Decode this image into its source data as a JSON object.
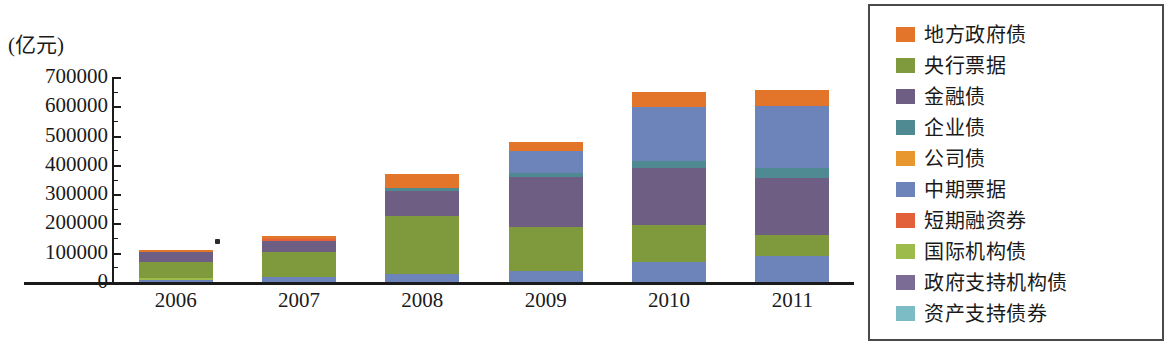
{
  "axes": {
    "unit_label": "(亿元)",
    "y_ticks": [
      "700000",
      "600000",
      "500000",
      "400000",
      "300000",
      "200000",
      "100000",
      "0"
    ],
    "x_ticks": [
      "2006",
      "2007",
      "2008",
      "2009",
      "2010",
      "2011"
    ]
  },
  "legend": {
    "items": [
      {
        "label": "地方政府债",
        "color": "#e2752a"
      },
      {
        "label": "央行票据",
        "color": "#7f9a3c"
      },
      {
        "label": "金融债",
        "color": "#6e5e84"
      },
      {
        "label": "企业债",
        "color": "#4f8a92"
      },
      {
        "label": "公司债",
        "color": "#e8972f"
      },
      {
        "label": "中期票据",
        "color": "#6d84bb"
      },
      {
        "label": "短期融资券",
        "color": "#e2603a"
      },
      {
        "label": "国际机构债",
        "color": "#9cbb4a"
      },
      {
        "label": "政府支持机构债",
        "color": "#7b6c96"
      },
      {
        "label": "资产支持债券",
        "color": "#7cbcc4"
      }
    ]
  },
  "chart_data": {
    "type": "bar",
    "subtype": "stacked",
    "title": "",
    "xlabel": "",
    "ylabel": "(亿元)",
    "ylim": [
      0,
      700000
    ],
    "y_tick_step": 100000,
    "y_minor_tick_step": 50000,
    "grid": false,
    "legend_position": "right",
    "categories": [
      "2006",
      "2007",
      "2008",
      "2009",
      "2010",
      "2011"
    ],
    "series": [
      {
        "name": "中期票据",
        "color": "#6d84bb",
        "values": [
          6000,
          16000,
          29000,
          36000,
          66000,
          86000
        ]
      },
      {
        "name": "国际机构债",
        "color": "#9cbb4a",
        "values": [
          2000,
          2000,
          2000,
          2000,
          2000,
          2000
        ]
      },
      {
        "name": "央行票据",
        "color": "#7f9a3c",
        "values": [
          55000,
          86000,
          196000,
          148000,
          124000,
          73000
        ]
      },
      {
        "name": "金融债",
        "color": "#6e5e84",
        "values": [
          30000,
          35000,
          74000,
          158000,
          196000,
          192000
        ]
      },
      {
        "name": "企业债",
        "color": "#4f8a92",
        "values": [
          2000,
          2000,
          6000,
          11000,
          22000,
          33000
        ]
      },
      {
        "name": "短期融资券",
        "color": "#6d84bb",
        "values": [
          3000,
          7000,
          40000,
          78000,
          186000,
          214000
        ]
      },
      {
        "name": "地方政府债",
        "color": "#e2752a",
        "values": [
          7000,
          7000,
          23000,
          47000,
          54000,
          55000
        ]
      }
    ],
    "totals": [
      105000,
      155000,
      370000,
      480000,
      650000,
      655000
    ],
    "bar_segments": [
      {
        "category": "2006",
        "segments": [
          {
            "name": "中期票据",
            "color": "#6d84bb",
            "value": 6000
          },
          {
            "name": "国际机构债",
            "color": "#9cbb4a",
            "value": 2000
          },
          {
            "name": "央行票据",
            "color": "#7f9a3c",
            "value": 55000
          },
          {
            "name": "金融债",
            "color": "#6e5e84",
            "value": 33000
          },
          {
            "name": "地方政府债",
            "color": "#e2752a",
            "value": 9000
          }
        ]
      },
      {
        "category": "2007",
        "segments": [
          {
            "name": "中期票据",
            "color": "#6d84bb",
            "value": 16000
          },
          {
            "name": "央行票据",
            "color": "#7f9a3c",
            "value": 88000
          },
          {
            "name": "金融债",
            "color": "#6e5e84",
            "value": 37000
          },
          {
            "name": "短期融资券",
            "color": "#e2603a",
            "value": 5000
          },
          {
            "name": "地方政府债",
            "color": "#e2752a",
            "value": 9000
          }
        ]
      },
      {
        "category": "2008",
        "segments": [
          {
            "name": "中期票据",
            "color": "#6d84bb",
            "value": 29000
          },
          {
            "name": "央行票据",
            "color": "#7f9a3c",
            "value": 198000
          },
          {
            "name": "金融债",
            "color": "#6e5e84",
            "value": 85000
          },
          {
            "name": "企业债",
            "color": "#4f8a92",
            "value": 9000
          },
          {
            "name": "地方政府债",
            "color": "#e2752a",
            "value": 49000
          }
        ]
      },
      {
        "category": "2009",
        "segments": [
          {
            "name": "中期票据",
            "color": "#6d84bb",
            "value": 36000
          },
          {
            "name": "央行票据",
            "color": "#7f9a3c",
            "value": 152000
          },
          {
            "name": "金融债",
            "color": "#6e5e84",
            "value": 172000
          },
          {
            "name": "企业债",
            "color": "#4f8a92",
            "value": 12000
          },
          {
            "name": "短期融资券",
            "color": "#6d84bb",
            "value": 76000
          },
          {
            "name": "地方政府债",
            "color": "#e2752a",
            "value": 32000
          }
        ]
      },
      {
        "category": "2010",
        "segments": [
          {
            "name": "中期票据",
            "color": "#6d84bb",
            "value": 68000
          },
          {
            "name": "央行票据",
            "color": "#7f9a3c",
            "value": 128000
          },
          {
            "name": "金融债",
            "color": "#6e5e84",
            "value": 194000
          },
          {
            "name": "企业债",
            "color": "#4f8a92",
            "value": 24000
          },
          {
            "name": "短期融资券",
            "color": "#6d84bb",
            "value": 182000
          },
          {
            "name": "地方政府债",
            "color": "#e2752a",
            "value": 54000
          }
        ]
      },
      {
        "category": "2011",
        "segments": [
          {
            "name": "中期票据",
            "color": "#6d84bb",
            "value": 88000
          },
          {
            "name": "央行票据",
            "color": "#7f9a3c",
            "value": 74000
          },
          {
            "name": "金融债",
            "color": "#6e5e84",
            "value": 194000
          },
          {
            "name": "企业债",
            "color": "#4f8a92",
            "value": 34000
          },
          {
            "name": "短期融资券",
            "color": "#6d84bb",
            "value": 212000
          },
          {
            "name": "地方政府债",
            "color": "#e2752a",
            "value": 53000
          }
        ]
      }
    ]
  }
}
